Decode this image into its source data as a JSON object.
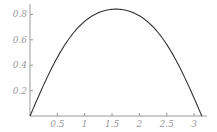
{
  "chart_data": {
    "type": "line",
    "title": "",
    "xlabel": "",
    "ylabel": "",
    "function": "sin(sin(x))",
    "xlim": [
      0,
      3.1416
    ],
    "ylim": [
      0,
      0.8415
    ],
    "grid": false,
    "legend": null,
    "x_ticks": [
      {
        "value": 0.5,
        "label": "0.5"
      },
      {
        "value": 1,
        "label": "1"
      },
      {
        "value": 1.5,
        "label": "1.5"
      },
      {
        "value": 2,
        "label": "2"
      },
      {
        "value": 2.5,
        "label": "2.5"
      },
      {
        "value": 3,
        "label": "3"
      }
    ],
    "y_ticks": [
      {
        "value": 0.2,
        "label": "0.2"
      },
      {
        "value": 0.4,
        "label": "0.4"
      },
      {
        "value": 0.6,
        "label": "0.6"
      },
      {
        "value": 0.8,
        "label": "0.8"
      }
    ],
    "series": [
      {
        "name": "curve",
        "x": [
          0,
          0.25,
          0.5,
          0.75,
          1.0,
          1.25,
          1.5,
          1.5708,
          1.75,
          2.0,
          2.25,
          2.5,
          2.75,
          3.0,
          3.1416
        ],
        "values": [
          0,
          0.245,
          0.461,
          0.628,
          0.746,
          0.815,
          0.84,
          0.841,
          0.833,
          0.789,
          0.694,
          0.547,
          0.365,
          0.14,
          0
        ]
      }
    ],
    "colors": {
      "line": "#333333",
      "axis": "#999999",
      "labels": "#9a9a9a"
    }
  }
}
